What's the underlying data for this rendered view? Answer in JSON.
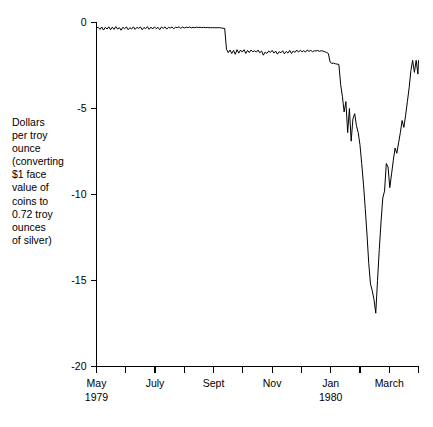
{
  "chart_data": {
    "type": "line",
    "title": "",
    "xlabel": "",
    "ylabel": "Dollars\nper troy\nounce\n(converting\n$1 face\nvalue of\ncoins to\n0.72 troy\nounces\nof silver)",
    "ylabel_lines": [
      "Dollars",
      "per troy",
      "ounce",
      "(converting",
      "$1 face",
      "value of",
      "coins to",
      "0.72 troy",
      "ounces",
      "of silver)"
    ],
    "ylim": [
      -20,
      0
    ],
    "ytick_values": [
      0,
      -5,
      -10,
      -15,
      -20
    ],
    "ytick_labels": [
      "0",
      "-5",
      "-10",
      "-15",
      "-20"
    ],
    "xlim": [
      0,
      11
    ],
    "xtick_values": [
      0,
      1,
      2,
      3,
      4,
      5,
      6,
      7,
      8,
      9,
      10,
      11
    ],
    "xtick_labels": [
      "May",
      "",
      "July",
      "",
      "Sept",
      "",
      "Nov",
      "",
      "Jan",
      "",
      "March",
      ""
    ],
    "xtick_sublabels": [
      "1979",
      "",
      "",
      "",
      "",
      "",
      "",
      "",
      "1980",
      "",
      "",
      ""
    ],
    "grid": false,
    "legend": false,
    "line_color": "#000000",
    "line_width": 1,
    "background": "#ffffff",
    "series": [
      {
        "name": "Silver coin premium",
        "x": [
          0.0,
          0.06,
          0.12,
          0.18,
          0.24,
          0.3,
          0.36,
          0.42,
          0.48,
          0.54,
          0.6,
          0.66,
          0.72,
          0.78,
          0.84,
          0.9,
          0.96,
          1.02,
          1.08,
          1.14,
          1.2,
          1.26,
          1.32,
          1.38,
          1.44,
          1.5,
          1.56,
          1.62,
          1.68,
          1.74,
          1.8,
          1.86,
          1.92,
          1.98,
          2.04,
          2.1,
          2.16,
          2.22,
          2.28,
          2.34,
          2.4,
          2.46,
          2.52,
          2.58,
          2.64,
          2.7,
          2.76,
          2.82,
          2.88,
          2.94,
          3.0,
          3.06,
          3.12,
          3.18,
          3.24,
          3.3,
          3.36,
          3.42,
          3.48,
          3.54,
          3.6,
          3.66,
          3.72,
          3.78,
          3.84,
          3.9,
          3.96,
          4.02,
          4.08,
          4.14,
          4.2,
          4.26,
          4.32,
          4.38,
          4.44,
          4.5,
          4.56,
          4.62,
          4.68,
          4.74,
          4.8,
          4.86,
          4.92,
          4.98,
          5.04,
          5.1,
          5.16,
          5.22,
          5.28,
          5.34,
          5.4,
          5.46,
          5.52,
          5.58,
          5.64,
          5.7,
          5.76,
          5.82,
          5.88,
          5.94,
          6.0,
          6.06,
          6.12,
          6.18,
          6.24,
          6.3,
          6.36,
          6.42,
          6.48,
          6.54,
          6.6,
          6.66,
          6.72,
          6.78,
          6.84,
          6.9,
          6.96,
          7.02,
          7.08,
          7.14,
          7.2,
          7.26,
          7.32,
          7.38,
          7.44,
          7.5,
          7.56,
          7.62,
          7.68,
          7.74,
          7.8,
          7.86,
          7.92,
          7.98,
          8.04,
          8.1,
          8.16,
          8.22,
          8.28,
          8.34,
          8.4,
          8.46,
          8.52,
          8.58,
          8.64,
          8.7,
          8.76,
          8.82,
          8.88,
          8.94,
          9.0,
          9.06,
          9.12,
          9.18,
          9.24,
          9.3,
          9.36,
          9.42,
          9.48,
          9.54,
          9.6,
          9.66,
          9.72,
          9.78,
          9.84,
          9.9,
          9.96,
          10.02,
          10.08,
          10.14,
          10.2,
          10.26,
          10.32,
          10.38,
          10.44,
          10.5,
          10.56,
          10.62,
          10.68,
          10.74,
          10.8,
          10.86,
          10.92,
          10.98,
          11.0
        ],
        "y": [
          -0.3,
          -0.28,
          -0.4,
          -0.26,
          -0.44,
          -0.28,
          -0.38,
          -0.25,
          -0.42,
          -0.27,
          -0.4,
          -0.24,
          -0.38,
          -0.3,
          -0.45,
          -0.28,
          -0.36,
          -0.26,
          -0.42,
          -0.3,
          -0.38,
          -0.25,
          -0.4,
          -0.28,
          -0.34,
          -0.26,
          -0.42,
          -0.29,
          -0.36,
          -0.24,
          -0.4,
          -0.27,
          -0.38,
          -0.25,
          -0.36,
          -0.28,
          -0.42,
          -0.26,
          -0.34,
          -0.25,
          -0.38,
          -0.28,
          -0.32,
          -0.26,
          -0.36,
          -0.27,
          -0.3,
          -0.25,
          -0.34,
          -0.26,
          -0.32,
          -0.27,
          -0.3,
          -0.26,
          -0.31,
          -0.28,
          -0.3,
          -0.27,
          -0.29,
          -0.28,
          -0.3,
          -0.28,
          -0.3,
          -0.29,
          -0.3,
          -0.3,
          -0.3,
          -0.3,
          -0.31,
          -0.3,
          -0.3,
          -0.32,
          -0.33,
          -0.35,
          -1.55,
          -1.75,
          -1.6,
          -1.8,
          -1.62,
          -1.85,
          -1.58,
          -1.78,
          -1.6,
          -1.72,
          -1.58,
          -1.8,
          -1.62,
          -1.75,
          -1.6,
          -1.7,
          -1.64,
          -1.72,
          -1.6,
          -1.76,
          -1.66,
          -1.9,
          -1.72,
          -1.8,
          -1.66,
          -1.74,
          -1.62,
          -1.78,
          -1.66,
          -1.84,
          -1.7,
          -1.76,
          -1.64,
          -1.82,
          -1.68,
          -1.78,
          -1.62,
          -1.8,
          -1.66,
          -1.74,
          -1.6,
          -1.72,
          -1.62,
          -1.7,
          -1.64,
          -1.72,
          -1.6,
          -1.68,
          -1.62,
          -1.7,
          -1.64,
          -1.66,
          -1.62,
          -1.68,
          -1.64,
          -1.66,
          -1.7,
          -1.74,
          -1.8,
          -2.3,
          -2.38,
          -2.36,
          -2.4,
          -2.42,
          -2.44,
          -3.6,
          -4.3,
          -5.2,
          -4.6,
          -6.4,
          -5.0,
          -6.9,
          -5.6,
          -5.3,
          -6.0,
          -6.4,
          -7.1,
          -8.2,
          -9.4,
          -10.8,
          -12.3,
          -14.0,
          -15.2,
          -15.6,
          -16.1,
          -16.9,
          -15.0,
          -13.2,
          -11.6,
          -10.2,
          -9.8,
          -8.2,
          -8.4,
          -9.6,
          -8.8,
          -8.0,
          -7.3,
          -7.6,
          -7.0,
          -6.4,
          -5.7,
          -6.1,
          -5.4,
          -4.6,
          -3.8,
          -2.8,
          -2.2,
          -2.9,
          -2.2,
          -3.0,
          -2.2
        ]
      }
    ],
    "annotations": [],
    "notes": {
      "plateau_1_level": -0.3,
      "plateau_2_level": -1.7,
      "minimum_value": -16.9,
      "final_value": -0.55
    }
  },
  "axes": {
    "y_axis_name": "y-axis",
    "x_axis_name": "x-axis"
  }
}
